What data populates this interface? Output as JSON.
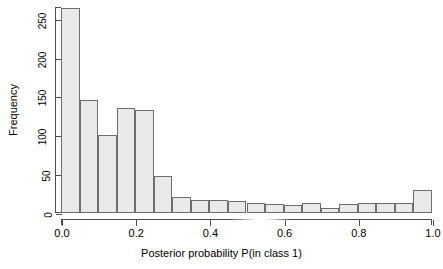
{
  "chart_data": {
    "type": "bar",
    "title": "",
    "subtitle": "",
    "xlabel": "Posterior probability P(in class 1)",
    "ylabel": "Frequency",
    "xlim": [
      0.0,
      1.0
    ],
    "ylim": [
      0,
      265
    ],
    "grid": false,
    "legend": null,
    "bin_width": 0.05,
    "xticks": [
      "0.0",
      "0.2",
      "0.4",
      "0.6",
      "0.8",
      "1.0"
    ],
    "xtick_values": [
      0.0,
      0.2,
      0.4,
      0.6,
      0.8,
      1.0
    ],
    "yticks": [
      "0",
      "50",
      "100",
      "150",
      "200",
      "250"
    ],
    "ytick_values": [
      0,
      50,
      100,
      150,
      200,
      250
    ],
    "categories": [
      "0.00-0.05",
      "0.05-0.10",
      "0.10-0.15",
      "0.15-0.20",
      "0.20-0.25",
      "0.25-0.30",
      "0.30-0.35",
      "0.35-0.40",
      "0.40-0.45",
      "0.45-0.50",
      "0.50-0.55",
      "0.55-0.60",
      "0.60-0.65",
      "0.65-0.70",
      "0.70-0.75",
      "0.75-0.80",
      "0.80-0.85",
      "0.85-0.90",
      "0.90-0.95",
      "0.95-1.00"
    ],
    "bin_edges": [
      0.0,
      0.05,
      0.1,
      0.15,
      0.2,
      0.25,
      0.3,
      0.35,
      0.4,
      0.45,
      0.5,
      0.55,
      0.6,
      0.65,
      0.7,
      0.75,
      0.8,
      0.85,
      0.9,
      0.95,
      1.0
    ],
    "values": [
      264,
      145,
      101,
      135,
      132,
      47,
      20,
      17,
      17,
      16,
      13,
      11,
      10,
      13,
      6,
      11,
      13,
      13,
      13,
      29
    ],
    "colors": {
      "bar_fill": "#e9e9e9",
      "bar_border": "#6e6e6e",
      "axis": "#4d4d4d",
      "text": "#000000",
      "background": "#ffffff"
    }
  }
}
